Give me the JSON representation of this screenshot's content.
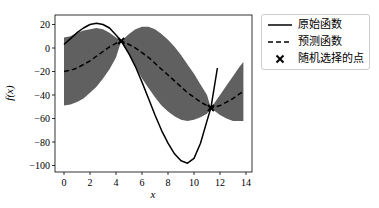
{
  "chart_data": {
    "type": "line",
    "title": "",
    "xlabel": "x",
    "ylabel": "f(x)",
    "xlim": [
      -0.6,
      14.4
    ],
    "ylim": [
      -105,
      28
    ],
    "xticks": [
      0,
      2,
      4,
      6,
      8,
      10,
      12,
      14
    ],
    "yticks": [
      20,
      0,
      -20,
      -40,
      -60,
      -80,
      -100
    ],
    "grid": false,
    "legend_position": "outside upper right",
    "series": [
      {
        "name": "原始函数",
        "style": "solid",
        "color": "#000000",
        "x": [
          0,
          0.5,
          1,
          1.5,
          2,
          2.5,
          3,
          3.5,
          4,
          4.4,
          5,
          5.5,
          6,
          6.5,
          7,
          7.5,
          8,
          8.5,
          9,
          9.5,
          10,
          10.5,
          11,
          11.3,
          11.8
        ],
        "y": [
          3,
          8,
          13,
          17,
          20,
          21,
          20,
          17,
          11,
          6,
          -5,
          -16,
          -29,
          -43,
          -57,
          -70,
          -81,
          -90,
          -96,
          -98,
          -94,
          -81,
          -62,
          -51,
          -17
        ]
      },
      {
        "name": "预测函数",
        "style": "dashed",
        "color": "#000000",
        "x": [
          0,
          0.5,
          1,
          1.5,
          2,
          2.5,
          3,
          3.5,
          4,
          4.4,
          5,
          5.5,
          6,
          6.5,
          7,
          7.5,
          8,
          8.5,
          9,
          9.5,
          10,
          10.5,
          11,
          11.3,
          12,
          12.5,
          13,
          13.5,
          13.8
        ],
        "y": [
          -20,
          -19,
          -17,
          -14,
          -11,
          -7,
          -3,
          1,
          4,
          6,
          3,
          0,
          -4,
          -8,
          -13,
          -18,
          -23,
          -28,
          -33,
          -38,
          -42,
          -46,
          -49,
          -51,
          -49,
          -46,
          -43,
          -39,
          -37
        ]
      },
      {
        "name": "置信区间",
        "style": "fill",
        "color": "#606060",
        "x": [
          0,
          0.5,
          1,
          1.5,
          2,
          2.5,
          3,
          3.5,
          4,
          4.4,
          5,
          5.5,
          6,
          6.5,
          7,
          7.5,
          8,
          8.5,
          9,
          9.5,
          10,
          10.5,
          11,
          11.3,
          12,
          12.5,
          13,
          13.5,
          13.8
        ],
        "upper": [
          9,
          10,
          13,
          15,
          16,
          17,
          16,
          13,
          9,
          6,
          12,
          16,
          18,
          18,
          16,
          12,
          7,
          1,
          -6,
          -14,
          -22,
          -31,
          -40,
          -51,
          -40,
          -32,
          -24,
          -16,
          -12
        ],
        "lower": [
          -49,
          -48,
          -46,
          -43,
          -38,
          -33,
          -26,
          -18,
          -8,
          6,
          -6,
          -16,
          -26,
          -34,
          -42,
          -49,
          -54,
          -58,
          -61,
          -62,
          -61,
          -59,
          -56,
          -51,
          -57,
          -60,
          -62,
          -62,
          -62
        ]
      }
    ],
    "points": {
      "name": "随机选择的点",
      "marker": "x",
      "x": [
        4.4,
        11.3
      ],
      "y": [
        6,
        -51
      ]
    }
  },
  "legend": {
    "items": [
      {
        "label": "原始函数",
        "style": "solid"
      },
      {
        "label": "预测函数",
        "style": "dashed"
      },
      {
        "label": "随机选择的点",
        "style": "marker-x"
      }
    ]
  }
}
